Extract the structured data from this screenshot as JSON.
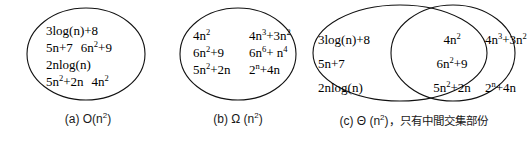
{
  "figure": {
    "width": 527,
    "height": 141,
    "stroke_color": "#111111",
    "background": "#ffffff"
  },
  "panels": [
    {
      "id": "a",
      "shape": "ellipse",
      "caption_prefix": "(a)",
      "caption_notation": "O(n",
      "caption_exponent": "2",
      "caption_suffix": ")",
      "caption_note": "",
      "terms": [
        [
          "3log(n)+8"
        ],
        [
          "5n+7",
          "6n",
          "+9"
        ],
        [
          "2nlog(n)"
        ],
        [
          "5n",
          "+2n",
          "4n",
          ""
        ]
      ],
      "terms_plain": [
        "3log(n)+8",
        "5n+7",
        "6n²+9",
        "2nlog(n)",
        "5n²+2n",
        "4n²"
      ]
    },
    {
      "id": "b",
      "shape": "ellipse",
      "caption_prefix": "(b)",
      "caption_notation": "Ω (n",
      "caption_exponent": "2",
      "caption_suffix": ")",
      "caption_note": "",
      "terms_plain": [
        "4n²",
        "4n³+3n²",
        "6n²+9",
        "6n⁶+ n⁴",
        "5n²+2n",
        "2ⁿ+4n"
      ]
    },
    {
      "id": "c",
      "shape": "two-overlapping-circles",
      "caption_prefix": "(c)",
      "caption_notation": "Θ (n",
      "caption_exponent": "2",
      "caption_suffix": ")",
      "caption_note": "，只有中間交集部份",
      "left_only_terms": [
        "3log(n)+8",
        "5n+7",
        "2nlog(n)"
      ],
      "intersection_terms": [
        "4n²",
        "6n²+9",
        "5n²+2n"
      ],
      "right_only_terms": [
        "4n³+3n²",
        "2ⁿ+4n"
      ]
    }
  ],
  "text": {
    "a_l1": "3log(n)+8",
    "a_l2a": "5n+7",
    "a_l2b_base": "6n",
    "a_l2b_sup": "2",
    "a_l2b_tail": "+9",
    "a_l3": "2nlog(n)",
    "a_l4a_base": "5n",
    "a_l4a_sup": "2",
    "a_l4a_tail": "+2n",
    "a_l4b_base": "4n",
    "a_l4b_sup": "2",
    "b_r1c1_base": "4n",
    "b_r1c1_sup": "2",
    "b_r1c2_base": "4n",
    "b_r1c2_sup": "3",
    "b_r1c2_mid": "+3n",
    "b_r1c2_sup2": "2",
    "b_r2c1_base": "6n",
    "b_r2c1_sup": "2",
    "b_r2c1_tail": "+9",
    "b_r2c2_base": "6n",
    "b_r2c2_sup": "6",
    "b_r2c2_mid": "+ n",
    "b_r2c2_sup2": "4",
    "b_r3c1_base": "5n",
    "b_r3c1_sup": "2",
    "b_r3c1_tail": "+2n",
    "b_r3c2_base": "2",
    "b_r3c2_sup": "n",
    "b_r3c2_tail": "+4n",
    "c_l1": "3log(n)+8",
    "c_l2": "5n+7",
    "c_l3": "2nlog(n)",
    "c_m1_base": "4n",
    "c_m1_sup": "2",
    "c_m2_base": "6n",
    "c_m2_sup": "2",
    "c_m2_tail": "+9",
    "c_m3_base": "5n",
    "c_m3_sup": "2",
    "c_m3_tail": "+2n",
    "c_r1_base": "4n",
    "c_r1_sup": "3",
    "c_r1_mid": "+3n",
    "c_r1_sup2": "2",
    "c_r2_base": "2",
    "c_r2_sup": "n",
    "c_r2_tail": "+4n",
    "cap_a_prefix": "(a)",
    "cap_a_name": "O(n",
    "cap_a_sup": "2",
    "cap_a_close": ")",
    "cap_b_prefix": "(b)",
    "cap_b_name": "Ω (n",
    "cap_b_sup": "2",
    "cap_b_close": ")",
    "cap_c_prefix": "(c)",
    "cap_c_name": "Θ (n",
    "cap_c_sup": "2",
    "cap_c_close": ")",
    "cap_c_note": "，只有中間交集部份"
  }
}
